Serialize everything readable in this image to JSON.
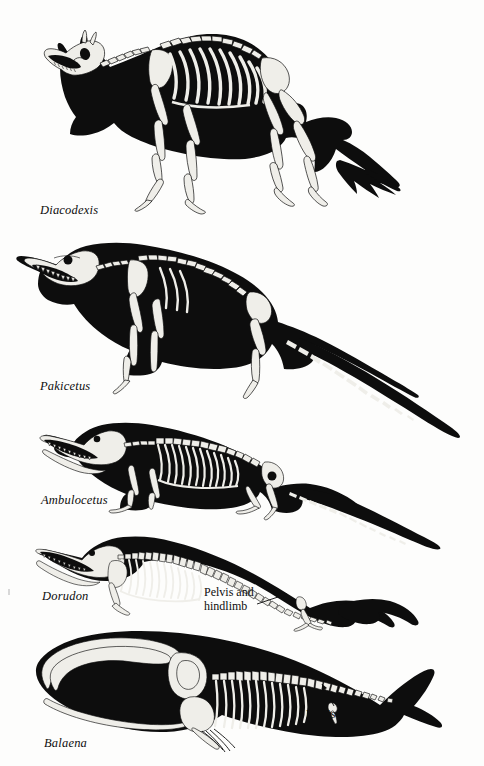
{
  "figure": {
    "title_visible": false,
    "background_color": "#fdfdfc",
    "ink_color": "#0d0d0d",
    "bone_color": "#efeee9",
    "panel_count": 5
  },
  "specimens": [
    {
      "id": "diacodexis",
      "label": "Diacodexis",
      "label_x": 40,
      "label_y": 203,
      "description": "small deer-like artiodactyl skeleton in black body silhouette, standing on four slender hoofed legs with long brushy tail",
      "annotation": null
    },
    {
      "id": "pakicetus",
      "label": "Pakicetus",
      "label_x": 40,
      "label_y": 379,
      "description": "wolf-sized early whale ancestor with long tapering tail and four walking legs",
      "annotation": null
    },
    {
      "id": "ambulocetus",
      "label": "Ambulocetus",
      "label_x": 41,
      "label_y": 493,
      "description": "crocodile-like amphibious whale with long toothy jaws, short limbs with broad feet and thick tail",
      "annotation": null
    },
    {
      "id": "dorudon",
      "label": "Dorudon",
      "label_x": 42,
      "label_y": 589,
      "description": "fully aquatic archaeocete with elongated body, flippers and reduced hind limbs",
      "annotation": {
        "text_line_1": "Pelvis and",
        "text_line_2": "hindlimb",
        "text_x": 204,
        "text_y": 586,
        "leader_from_x": 268,
        "leader_from_y": 601,
        "leader_to_x": 296,
        "leader_to_y": 592
      }
    },
    {
      "id": "balaena",
      "label": "Balaena",
      "label_x": 44,
      "label_y": 736,
      "description": "modern bowhead whale silhouette with huge arched jaw, baleen, flipper and vestigial pelvis",
      "annotation": {
        "text_line_1": "Pelvis and",
        "text_line_2": "hindlimb",
        "text_x": 306,
        "text_y": 708,
        "leader_from_x": 322,
        "leader_from_y": 703,
        "leader_to_x": 334,
        "leader_to_y": 684
      }
    }
  ],
  "annotation_labels": {
    "pelvis_and": "Pelvis and",
    "hindlimb": "hindlimb"
  }
}
